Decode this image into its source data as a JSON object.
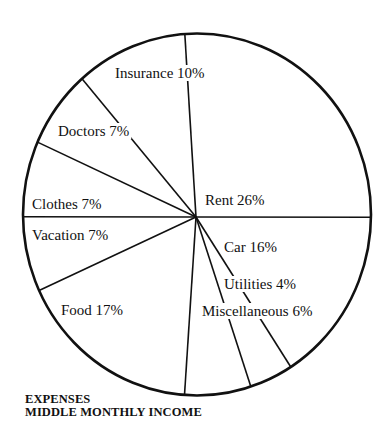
{
  "chart_data": {
    "type": "pie",
    "title": "EXPENSES",
    "subtitle": "MIDDLE MONTHLY INCOME",
    "unit": "%",
    "direction": "clockwise",
    "start": "top",
    "legend": "none (labels inside slices)",
    "slices": [
      {
        "label": "Rent",
        "value": 26,
        "display": "Rent 26%"
      },
      {
        "label": "Car",
        "value": 16,
        "display": "Car 16%"
      },
      {
        "label": "Utilities",
        "value": 4,
        "display": "Utilities 4%"
      },
      {
        "label": "Miscellaneous",
        "value": 6,
        "display": "Miscellaneous 6%"
      },
      {
        "label": "Food",
        "value": 17,
        "display": "Food 17%"
      },
      {
        "label": "Vacation",
        "value": 7,
        "display": "Vacation 7%"
      },
      {
        "label": "Clothes",
        "value": 7,
        "display": "Clothes 7%"
      },
      {
        "label": "Doctors",
        "value": 7,
        "display": "Doctors 7%"
      },
      {
        "label": "Insurance",
        "value": 10,
        "display": "Insurance 10%"
      }
    ],
    "colors": {
      "fill": "#ffffff",
      "stroke": "#111111",
      "text": "#111111"
    }
  }
}
